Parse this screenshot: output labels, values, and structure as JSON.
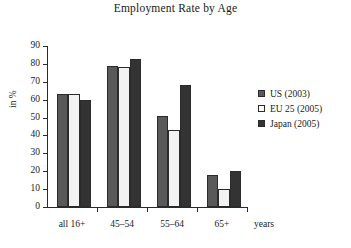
{
  "chart_data": {
    "type": "bar",
    "title": "Employment Rate by Age",
    "xlabel": "years",
    "ylabel": "in %",
    "ylim": [
      0,
      90
    ],
    "ytick_step": 10,
    "yticks": [
      0,
      10,
      20,
      30,
      40,
      50,
      60,
      70,
      80,
      90
    ],
    "grid": false,
    "legend_position": "right",
    "categories": [
      "all 16+",
      "45–54",
      "55–64",
      "65+"
    ],
    "series": [
      {
        "name": "US (2003)",
        "color": "#595959",
        "values": [
          63,
          79,
          51,
          18
        ]
      },
      {
        "name": "EU 25 (2005)",
        "color": "#f2f2f2",
        "values": [
          63,
          78,
          43,
          10
        ]
      },
      {
        "name": "Japan (2005)",
        "color": "#333333",
        "values": [
          60,
          83,
          68,
          20
        ]
      }
    ]
  }
}
